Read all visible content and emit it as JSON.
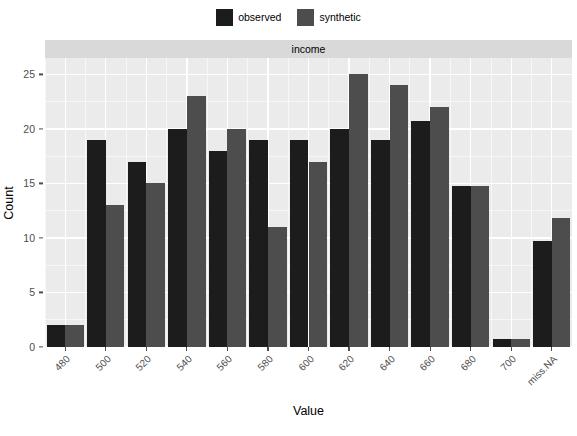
{
  "legend": {
    "entries": [
      {
        "label": "observed",
        "color": "#1c1c1c"
      },
      {
        "label": "synthetic",
        "color": "#4d4d4d"
      }
    ]
  },
  "facet": {
    "label": "income"
  },
  "axes": {
    "x_title": "Value",
    "y_title": "Count"
  },
  "chart_data": {
    "type": "bar",
    "title": "income",
    "xlabel": "Value",
    "ylabel": "Count",
    "ylim": [
      0,
      26.5
    ],
    "y_ticks": [
      0,
      5,
      10,
      15,
      20,
      25
    ],
    "y_minor_ticks": [
      2.5,
      7.5,
      12.5,
      17.5,
      22.5
    ],
    "grid": true,
    "legend_position": "top",
    "bar_mode": "grouped",
    "categories": [
      "480",
      "500",
      "520",
      "540",
      "560",
      "580",
      "600",
      "620",
      "640",
      "660",
      "680",
      "700",
      "miss.NA"
    ],
    "series": [
      {
        "name": "observed",
        "color": "#1c1c1c",
        "values": [
          2,
          19,
          17,
          20,
          18,
          19,
          19,
          20,
          19,
          20.7,
          14.8,
          0.7,
          9.7
        ]
      },
      {
        "name": "synthetic",
        "color": "#4d4d4d",
        "values": [
          2,
          13,
          15,
          23,
          20,
          11,
          17,
          25,
          24,
          22,
          14.8,
          0.7,
          11.8
        ]
      }
    ]
  }
}
